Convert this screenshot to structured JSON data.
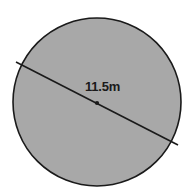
{
  "figure": {
    "type": "circle-diameter-diagram",
    "canvas": {
      "width": 196,
      "height": 194,
      "background_color": "#FFFFFF"
    },
    "circle": {
      "center_x": 97,
      "center_y": 102,
      "radius": 84,
      "fill_color": "#A8A8A8",
      "stroke_color": "#1A1A1A",
      "stroke_width": 1.6,
      "cropped_edge": "bottom"
    },
    "diameter_line": {
      "x1": 16,
      "y1": 62,
      "x2": 178,
      "y2": 145,
      "stroke_color": "#1A1A1A",
      "stroke_width": 1.6
    },
    "center_dot": {
      "cx": 97,
      "cy": 103,
      "r": 2.1,
      "fill_color": "#1A1A1A"
    },
    "label": {
      "text": "11.5m",
      "value": 11.5,
      "unit": "m",
      "measures": "diameter",
      "color": "#1A1A1A",
      "x": 85,
      "y": 80
    }
  }
}
